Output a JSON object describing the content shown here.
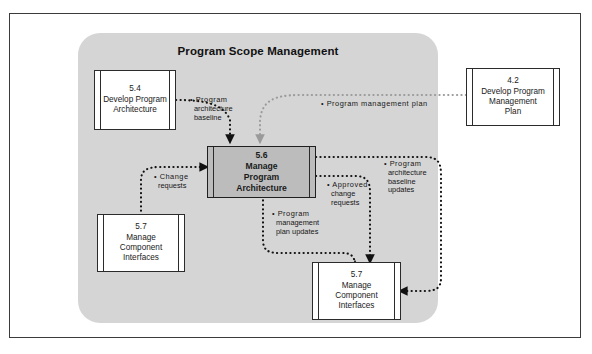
{
  "diagram": {
    "type": "data-flow-diagram",
    "panel_title": "Program Scope Management",
    "panel_color": "#d5d5d5",
    "frame_color": "#3b3b3b",
    "center_node_color": "#bcbcbc",
    "nodes": [
      {
        "key": "develop-program-architecture",
        "id": "5.4",
        "name": "Develop Program\nArchitecture",
        "line1": "Develop Program",
        "line2": "Architecture",
        "line3": "",
        "inside_panel": true,
        "emphasis": false
      },
      {
        "key": "develop-program-management-plan",
        "id": "4.2",
        "name": "Develop Program\nManagement\nPlan",
        "line1": "Develop Program",
        "line2": "Management",
        "line3": "Plan",
        "inside_panel": false,
        "emphasis": false
      },
      {
        "key": "manage-program-architecture",
        "id": "5.6",
        "name": "Manage\nProgram\nArchitecture",
        "line1": "Manage",
        "line2": "Program",
        "line3": "Architecture",
        "inside_panel": true,
        "emphasis": true
      },
      {
        "key": "manage-component-interfaces-left",
        "id": "5.7",
        "name": "Manage\nComponent\nInterfaces",
        "line1": "Manage",
        "line2": "Component",
        "line3": "Interfaces",
        "inside_panel": true,
        "emphasis": false
      },
      {
        "key": "manage-component-interfaces-bottom",
        "id": "5.7",
        "name": "Manage\nComponent\nInterfaces",
        "line1": "Manage",
        "line2": "Component",
        "line3": "Interfaces",
        "inside_panel": true,
        "emphasis": false
      }
    ],
    "flows": [
      {
        "key": "program-architecture-baseline",
        "label": "• Program\narchitecture\nbaseline",
        "line1": "• Program",
        "line2": "architecture",
        "line3": "baseline",
        "from": "5.4 Develop Program Architecture",
        "to": "5.6 Manage Program Architecture",
        "style": "dotted-black"
      },
      {
        "key": "program-management-plan",
        "label": "• Program management plan",
        "line1": "• Program management plan",
        "line2": "",
        "line3": "",
        "from": "4.2 Develop Program Management Plan",
        "to": "5.6 Manage Program Architecture",
        "style": "dotted-grey"
      },
      {
        "key": "change-requests",
        "label": "• Change\nrequests",
        "line1": "• Change",
        "line2": "requests",
        "line3": "",
        "from": "5.7 Manage Component Interfaces",
        "to": "5.6 Manage Program Architecture",
        "style": "dotted-black"
      },
      {
        "key": "approved-change-requests",
        "label": "• Approved\nchange\nrequests",
        "line1": "• Approved",
        "line2": "change",
        "line3": "requests",
        "from": "5.6 Manage Program Architecture",
        "to": "5.7 Manage Component Interfaces",
        "style": "dotted-black"
      },
      {
        "key": "program-management-plan-updates",
        "label": "• Program\nmanagement\nplan updates",
        "line1": "• Program",
        "line2": "management",
        "line3": "plan updates",
        "from": "5.6 Manage Program Architecture",
        "to": "5.7 Manage Component Interfaces",
        "style": "dotted-black"
      },
      {
        "key": "program-architecture-baseline-updates",
        "label": "• Program\narchitecture\nbaseline\nupdates",
        "line1": "• Program",
        "line2": "architecture",
        "line3": "baseline",
        "line4": "updates",
        "from": "5.6 Manage Program Architecture",
        "to": "5.7 Manage Component Interfaces",
        "style": "dotted-black"
      }
    ]
  }
}
